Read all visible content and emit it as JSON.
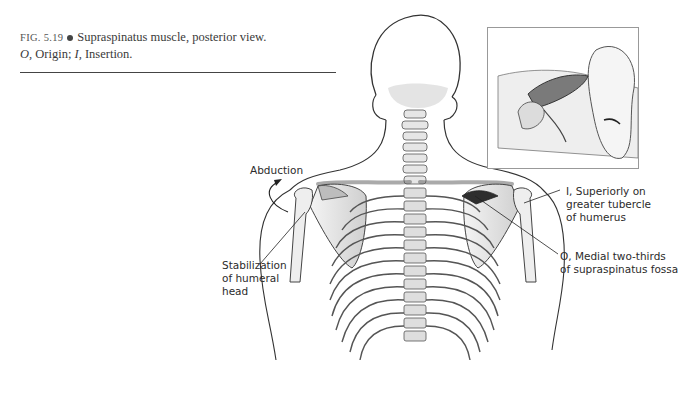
{
  "figure": {
    "number": "FIG. 5.19",
    "title": "Supraspinatus muscle, posterior view.",
    "legend_o": "O,",
    "legend_o_text": "Origin;",
    "legend_i": "I,",
    "legend_i_text": "Insertion."
  },
  "labels": {
    "abduction": "Abduction",
    "stabilization_line1": "Stabilization",
    "stabilization_line2": "of humeral",
    "stabilization_line3": "head",
    "insertion_line1": "I, Superiorly on",
    "insertion_line2": "greater tubercle",
    "insertion_line3": "of humerus",
    "origin_line1": "O, Medial two-thirds",
    "origin_line2": "of supraspinatus fossa"
  },
  "illustration": {
    "main": "posterior-view-torso-skeleton",
    "inset": "side-lying-patient-supraspinatus"
  }
}
